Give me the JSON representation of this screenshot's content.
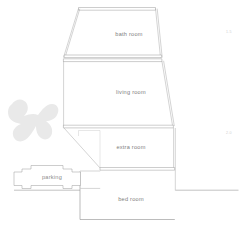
{
  "plan": {
    "title": "floor plan section",
    "rooms": [
      {
        "id": "bath",
        "label": "bath room",
        "label_x": 129,
        "label_y": 35
      },
      {
        "id": "living",
        "label": "living room",
        "label_x": 131,
        "label_y": 93
      },
      {
        "id": "extra",
        "label": "extra room",
        "label_x": 131,
        "label_y": 148
      },
      {
        "id": "bed",
        "label": "bed room",
        "label_x": 131,
        "label_y": 200
      }
    ],
    "features": [
      {
        "id": "parking",
        "label": "parking",
        "label_x": 52,
        "label_y": 178
      },
      {
        "id": "tree",
        "label": "tree-shrub"
      }
    ],
    "dimensions": [
      {
        "id": "dim-upper",
        "label": "1.5",
        "x": 226,
        "y": 32
      },
      {
        "id": "dim-lower",
        "label": "2.0",
        "x": 226,
        "y": 133
      }
    ],
    "colors": {
      "wall": "#8e8e8e",
      "wall_light": "#a8a8a8",
      "label": "#7d7d7d",
      "tree": "#e9e9e9",
      "background": "#ffffff",
      "dimension": "#cfcfcf"
    }
  }
}
